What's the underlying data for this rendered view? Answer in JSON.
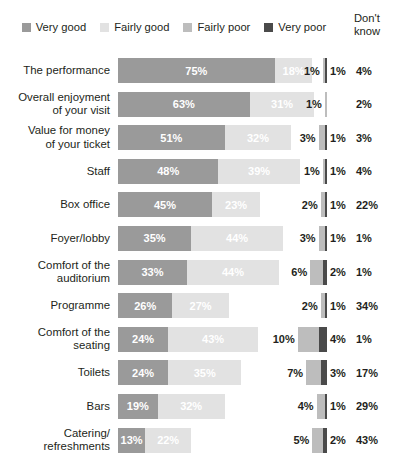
{
  "legend": {
    "items": [
      {
        "label": "Very good",
        "color": "#9a9a9a"
      },
      {
        "label": "Fairly good",
        "color": "#e2e2e2"
      },
      {
        "label": "Fairly poor",
        "color": "#bdbdbd"
      },
      {
        "label": "Very poor",
        "color": "#4a4a4a"
      }
    ]
  },
  "dont_know_header": {
    "line1": "Don't",
    "line2": "know"
  },
  "chart_data": {
    "type": "bar",
    "subtype": "stacked-horizontal-100",
    "title": "",
    "xlabel": "",
    "ylabel": "",
    "xlim": [
      0,
      100
    ],
    "grid": false,
    "legend_position": "top",
    "categories": [
      "The performance",
      "Overall enjoyment of your visit",
      "Value for money of your ticket",
      "Staff",
      "Box office",
      "Foyer/lobby",
      "Comfort of the auditorium",
      "Programme",
      "Comfort of the seating",
      "Toilets",
      "Bars",
      "Catering/refreshments"
    ],
    "series": [
      {
        "name": "Very good",
        "values": [
          75,
          63,
          51,
          48,
          45,
          35,
          33,
          26,
          24,
          24,
          19,
          13
        ]
      },
      {
        "name": "Fairly good",
        "values": [
          18,
          31,
          32,
          39,
          23,
          44,
          44,
          27,
          43,
          35,
          32,
          22
        ]
      },
      {
        "name": "Fairly poor",
        "values": [
          1,
          1,
          3,
          1,
          2,
          3,
          6,
          2,
          10,
          7,
          4,
          5
        ]
      },
      {
        "name": "Very poor",
        "values": [
          1,
          0,
          1,
          1,
          1,
          1,
          2,
          1,
          4,
          3,
          1,
          2
        ]
      },
      {
        "name": "Don't know",
        "values": [
          4,
          2,
          3,
          4,
          22,
          1,
          1,
          34,
          1,
          17,
          29,
          43
        ]
      }
    ]
  },
  "rows": [
    {
      "label_lines": [
        "The performance"
      ],
      "very_good": "75%",
      "fairly_good": "18%",
      "fairly_poor": "1%",
      "very_poor": "1%",
      "dont_know": "4%",
      "vg": 75,
      "fg": 18,
      "fp": 1,
      "vp": 1
    },
    {
      "label_lines": [
        "Overall enjoyment",
        "of your visit"
      ],
      "very_good": "63%",
      "fairly_good": "31%",
      "fairly_poor": "1%",
      "very_poor": "",
      "dont_know": "2%",
      "vg": 63,
      "fg": 31,
      "fp": 1,
      "vp": 0
    },
    {
      "label_lines": [
        "Value for money",
        "of your ticket"
      ],
      "very_good": "51%",
      "fairly_good": "32%",
      "fairly_poor": "3%",
      "very_poor": "1%",
      "dont_know": "3%",
      "vg": 51,
      "fg": 32,
      "fp": 3,
      "vp": 1
    },
    {
      "label_lines": [
        "Staff"
      ],
      "very_good": "48%",
      "fairly_good": "39%",
      "fairly_poor": "1%",
      "very_poor": "1%",
      "dont_know": "4%",
      "vg": 48,
      "fg": 39,
      "fp": 1,
      "vp": 1
    },
    {
      "label_lines": [
        "Box office"
      ],
      "very_good": "45%",
      "fairly_good": "23%",
      "fairly_poor": "2%",
      "very_poor": "1%",
      "dont_know": "22%",
      "vg": 45,
      "fg": 23,
      "fp": 2,
      "vp": 1
    },
    {
      "label_lines": [
        "Foyer/lobby"
      ],
      "very_good": "35%",
      "fairly_good": "44%",
      "fairly_poor": "3%",
      "very_poor": "1%",
      "dont_know": "1%",
      "vg": 35,
      "fg": 44,
      "fp": 3,
      "vp": 1
    },
    {
      "label_lines": [
        "Comfort of the",
        "auditorium"
      ],
      "very_good": "33%",
      "fairly_good": "44%",
      "fairly_poor": "6%",
      "very_poor": "2%",
      "dont_know": "1%",
      "vg": 33,
      "fg": 44,
      "fp": 6,
      "vp": 2
    },
    {
      "label_lines": [
        "Programme"
      ],
      "very_good": "26%",
      "fairly_good": "27%",
      "fairly_poor": "2%",
      "very_poor": "1%",
      "dont_know": "34%",
      "vg": 26,
      "fg": 27,
      "fp": 2,
      "vp": 1
    },
    {
      "label_lines": [
        "Comfort of the",
        "seating"
      ],
      "very_good": "24%",
      "fairly_good": "43%",
      "fairly_poor": "10%",
      "very_poor": "4%",
      "dont_know": "1%",
      "vg": 24,
      "fg": 43,
      "fp": 10,
      "vp": 4
    },
    {
      "label_lines": [
        "Toilets"
      ],
      "very_good": "24%",
      "fairly_good": "35%",
      "fairly_poor": "7%",
      "very_poor": "3%",
      "dont_know": "17%",
      "vg": 24,
      "fg": 35,
      "fp": 7,
      "vp": 3
    },
    {
      "label_lines": [
        "Bars"
      ],
      "very_good": "19%",
      "fairly_good": "32%",
      "fairly_poor": "4%",
      "very_poor": "1%",
      "dont_know": "29%",
      "vg": 19,
      "fg": 32,
      "fp": 4,
      "vp": 1
    },
    {
      "label_lines": [
        "Catering/",
        "refreshments"
      ],
      "very_good": "13%",
      "fairly_good": "22%",
      "fairly_poor": "5%",
      "very_poor": "2%",
      "dont_know": "43%",
      "vg": 13,
      "fg": 22,
      "fp": 5,
      "vp": 2
    }
  ]
}
